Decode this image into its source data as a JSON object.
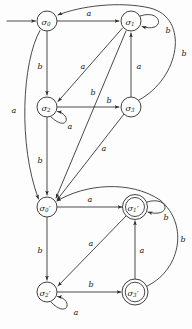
{
  "figure": {
    "width": 192,
    "height": 329,
    "ink_color": "#2b2b2b",
    "background_color": "#fdfdfd"
  },
  "automata": [
    {
      "id": "upper",
      "name": "upper-automaton",
      "start_state": "s0",
      "states": [
        {
          "id": "s0",
          "label_main": "σ",
          "label_sub": "0",
          "accepting": false,
          "cx": 47,
          "cy": 21,
          "r": 10
        },
        {
          "id": "s1",
          "label_main": "σ",
          "label_sub": "1",
          "accepting": false,
          "cx": 131,
          "cy": 21,
          "r": 10
        },
        {
          "id": "s2",
          "label_main": "σ",
          "label_sub": "2",
          "accepting": false,
          "cx": 47,
          "cy": 107,
          "r": 10
        },
        {
          "id": "s3",
          "label_main": "σ",
          "label_sub": "3",
          "accepting": false,
          "cx": 131,
          "cy": 107,
          "r": 10
        }
      ],
      "transitions": [
        {
          "from": "s0",
          "to": "s1",
          "symbol": "a",
          "label_x": 89,
          "label_y": 13
        },
        {
          "from": "s0",
          "to": "s2",
          "symbol": "b",
          "label_x": 40,
          "label_y": 66
        },
        {
          "from": "s0",
          "to": "s0p",
          "symbol": "a",
          "label_x": 14,
          "label_y": 110
        },
        {
          "from": "s1",
          "to": "s1",
          "symbol": "b",
          "label_x": 168,
          "label_y": 30
        },
        {
          "from": "s1",
          "to": "s2",
          "symbol": "a",
          "label_x": 83,
          "label_y": 66
        },
        {
          "from": "s1",
          "to": "s0p",
          "symbol": "b",
          "label_x": 93,
          "label_y": 92
        },
        {
          "from": "s2",
          "to": "s2",
          "symbol": "a",
          "label_x": 70,
          "label_y": 126
        },
        {
          "from": "s2",
          "to": "s3",
          "symbol": "b",
          "label_x": 109,
          "label_y": 100
        },
        {
          "from": "s2",
          "to": "s0p",
          "symbol": "b",
          "label_x": 40,
          "label_y": 160
        },
        {
          "from": "s3",
          "to": "s1",
          "symbol": "a",
          "label_x": 139,
          "label_y": 66
        },
        {
          "from": "s3",
          "to": "s0",
          "symbol": "b",
          "label_x": 184,
          "label_y": 53
        },
        {
          "from": "s3",
          "to": "s0p",
          "symbol": "a",
          "label_x": 104,
          "label_y": 148
        }
      ]
    },
    {
      "id": "lower",
      "name": "lower-automaton",
      "start_state": "s0p",
      "states": [
        {
          "id": "s0p",
          "label_main": "σ",
          "label_sub": "0",
          "prime": "′",
          "accepting": false,
          "cx": 47,
          "cy": 207,
          "r": 10
        },
        {
          "id": "s1p",
          "label_main": "σ",
          "label_sub": "1",
          "prime": "′",
          "accepting": true,
          "cx": 135,
          "cy": 207,
          "r": 10
        },
        {
          "id": "s2p",
          "label_main": "σ",
          "label_sub": "2",
          "prime": "′",
          "accepting": false,
          "cx": 47,
          "cy": 292,
          "r": 10
        },
        {
          "id": "s3p",
          "label_main": "σ",
          "label_sub": "3",
          "prime": "′",
          "accepting": true,
          "cx": 135,
          "cy": 292,
          "r": 10
        }
      ],
      "transitions": [
        {
          "from": "s0p",
          "to": "s1p",
          "symbol": "a",
          "label_x": 90,
          "label_y": 199
        },
        {
          "from": "s0p",
          "to": "s2p",
          "symbol": "b",
          "label_x": 40,
          "label_y": 250
        },
        {
          "from": "s1p",
          "to": "s1p",
          "symbol": "b",
          "label_x": 166,
          "label_y": 217
        },
        {
          "from": "s1p",
          "to": "s2p",
          "symbol": "a",
          "label_x": 91,
          "label_y": 243
        },
        {
          "from": "s2p",
          "to": "s2p",
          "symbol": "a",
          "label_x": 76,
          "label_y": 312
        },
        {
          "from": "s2p",
          "to": "s3p",
          "symbol": "b",
          "label_x": 91,
          "label_y": 284
        },
        {
          "from": "s3p",
          "to": "s1p",
          "symbol": "a",
          "label_x": 142,
          "label_y": 250
        },
        {
          "from": "s3p",
          "to": "s0p",
          "symbol": "b",
          "label_x": 183,
          "label_y": 239
        }
      ]
    }
  ],
  "alphabet": [
    "a",
    "b"
  ]
}
